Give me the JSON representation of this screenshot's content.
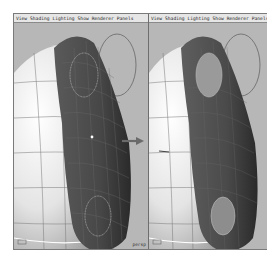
{
  "panels": [
    {
      "id": "left",
      "menu": [
        "View",
        "Shading",
        "Lighting",
        "Show",
        "Renderer",
        "Panels"
      ],
      "camera_label": "persp"
    },
    {
      "id": "right",
      "menu": [
        "View",
        "Shading",
        "Lighting",
        "Show",
        "Renderer",
        "Panels"
      ],
      "camera_label": ""
    }
  ],
  "transition_arrow": "right-arrow",
  "colors": {
    "viewport_bg": "#b7b7b7",
    "menubar_bg": "#e6e6e6",
    "mesh_dark": "#4a4a4a",
    "sphere_light": "#f2f2f2"
  }
}
